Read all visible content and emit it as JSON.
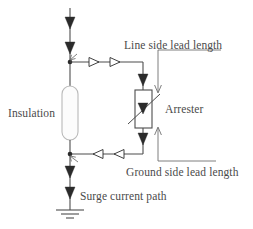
{
  "diagram": {
    "type": "electrical-schematic",
    "background_color": "#ffffff",
    "line_color": "#4d4d4d",
    "text_color": "#4a4a4a",
    "labels": {
      "line_side_lead_length": "Line side lead length",
      "insulation": "Insulation",
      "arrester": "Arrester",
      "ground_side_lead_length": "Ground side lead length",
      "surge_current_path": "Surge current path"
    },
    "components": {
      "insulation": {
        "name": "Insulation",
        "shape": "rounded-capsule",
        "fill": "#fcfcfc",
        "stroke": "#b9b9b9"
      },
      "arrester": {
        "name": "Arrester",
        "shape": "rectangle-with-diagonal",
        "symbol": "varistor",
        "fill": "#ffffff",
        "stroke": "#4d4d4d"
      },
      "ground": {
        "name": "Ground",
        "symbol": "earth-ground",
        "bars": 3
      }
    },
    "flow": {
      "direction_top": "downward",
      "direction_line_lead": "rightward",
      "direction_ground_lead": "leftward",
      "direction_bottom": "downward",
      "arrow_count_main_top": 2,
      "arrow_count_main_bottom": 2,
      "arrow_count_line_lead": 2,
      "arrow_count_ground_lead": 2
    }
  }
}
